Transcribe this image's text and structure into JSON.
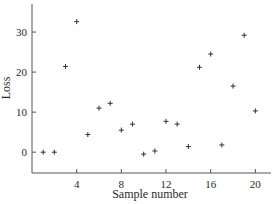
{
  "chart_data": {
    "type": "scatter",
    "title": "",
    "xlabel": "Sample number",
    "ylabel": "Loss",
    "xlim": [
      0,
      21.4
    ],
    "ylim": [
      -5.2,
      37
    ],
    "xticks": [
      4,
      8,
      12,
      16,
      20
    ],
    "yticks": [
      0,
      10,
      20,
      30
    ],
    "grid": false,
    "legend": null,
    "marker": "+",
    "series": [
      {
        "name": "Loss",
        "x": [
          1,
          2,
          3,
          4,
          5,
          6,
          7,
          8,
          9,
          10,
          11,
          12,
          13,
          14,
          15,
          16,
          17,
          18,
          19,
          20
        ],
        "y": [
          0,
          0,
          21.4,
          32.6,
          4.4,
          11,
          12.2,
          5.5,
          7,
          -0.5,
          0.3,
          7.7,
          7,
          1.4,
          21.2,
          24.5,
          1.8,
          16.5,
          29.2,
          10.3
        ]
      }
    ]
  },
  "colors": {
    "axis": "#555555",
    "marker": "#333333",
    "text": "#2a2a2a",
    "background": "#ffffff"
  }
}
